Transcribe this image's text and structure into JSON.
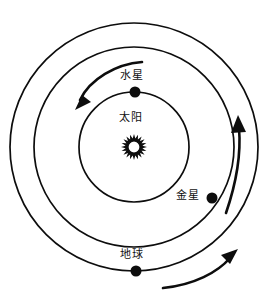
{
  "diagram": {
    "type": "solar-system-orbit-diagram",
    "center": {
      "x": 134,
      "y": 147
    },
    "stroke_color": "#0d0d0d",
    "background_color": "#ffffff",
    "sun": {
      "label": "太阳",
      "icon": "sun-icon",
      "cx": 134,
      "cy": 147,
      "ray_count": 20,
      "outer_radius": 13,
      "inner_radius": 8.5,
      "core_radius": 6
    },
    "orbits": [
      {
        "name": "mercury-orbit",
        "radius": 55,
        "body_label": "水星",
        "body_cx": 135,
        "body_cy": 92,
        "body_radius": 5.5,
        "direction": "counterclockwise"
      },
      {
        "name": "venus-orbit",
        "radius": 100,
        "body_label": "金星",
        "body_cx": 212,
        "body_cy": 198,
        "body_radius": 5.5,
        "direction": "counterclockwise"
      },
      {
        "name": "earth-orbit",
        "radius": 124,
        "body_label": "地球",
        "body_cx": 136,
        "body_cy": 271,
        "body_radius": 5.5,
        "direction": "counterclockwise"
      }
    ],
    "direction_arrows": [
      {
        "name": "mercury-direction-arrow",
        "path": "M 142 62 C 118 64 92 78 80 101",
        "head": "77,108 90,101 83,96",
        "points_to": "down-left"
      },
      {
        "name": "venus-direction-arrow",
        "path": "M 228 212 C 238 180 241 150 239 127",
        "head": "238,117 232,131 245,131",
        "points_to": "up"
      },
      {
        "name": "earth-direction-arrow",
        "path": "M 165 287 C 196 284 219 271 232 257",
        "head": "238,250 224,255 231,262",
        "points_to": "up-right"
      }
    ]
  },
  "labels": {
    "sun": "太阳",
    "mercury": "水星",
    "venus": "金星",
    "earth": "地球"
  }
}
